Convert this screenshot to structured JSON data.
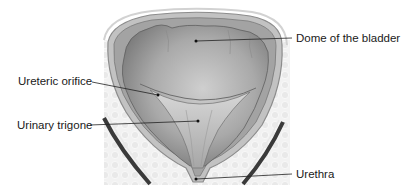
{
  "diagram": {
    "labels": [
      {
        "id": "dome",
        "text": "Dome of the bladder",
        "side": "right"
      },
      {
        "id": "ureteric-orifice",
        "text": "Ureteric orifice",
        "side": "left"
      },
      {
        "id": "urinary-trigone",
        "text": "Urinary trigone",
        "side": "left"
      },
      {
        "id": "urethra",
        "text": "Urethra",
        "side": "right"
      }
    ],
    "colors": {
      "background": "#ffffff",
      "tissue": "#ececec",
      "wall_outer": "#b9b9b9",
      "lumen": "#9a9a9a",
      "lumen_light": "#c4c4c4",
      "leader": "#222222",
      "muscle_band": "#3a3a3a"
    }
  }
}
